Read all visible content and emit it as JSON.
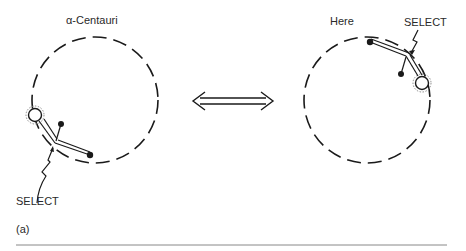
{
  "figure": {
    "panel_label": "(a)",
    "left": {
      "title": "α-Centauri",
      "select_label": "SELECT"
    },
    "right": {
      "title": "Here",
      "select_label": "SELECT"
    },
    "arrow": "double-headed-arrow"
  },
  "colors": {
    "ink": "#1a1a1a",
    "rule": "#888888"
  }
}
